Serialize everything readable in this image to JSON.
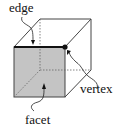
{
  "diagram": {
    "labels": {
      "edge": "edge",
      "vertex": "vertex",
      "facet": "facet"
    },
    "colors": {
      "facet_fill": "#c4c4c4",
      "line": "#333333",
      "edge_highlight": "#111111",
      "vertex_dot": "#111111"
    }
  }
}
